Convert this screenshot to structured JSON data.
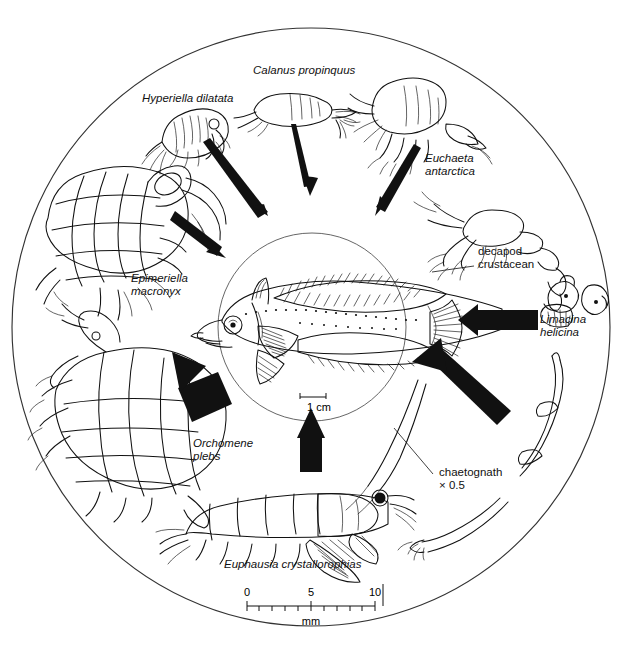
{
  "diagram": {
    "type": "food-web-circular",
    "title_visible": false,
    "center_organism": {
      "name": "antarctic-fish",
      "scalebar_label": "1 cm",
      "scalebar_length_px": 26
    },
    "outer_circle": {
      "cx": 311,
      "cy": 327,
      "r": 299
    },
    "inner_circle": {
      "cx": 312,
      "cy": 327,
      "r": 94
    },
    "prey": [
      {
        "id": "hyperiella",
        "label": "Hyperiella dilatata",
        "italic": true,
        "x": 142,
        "y": 92,
        "w": 126,
        "align": "left"
      },
      {
        "id": "calanus",
        "label": "Calanus propinquus",
        "italic": true,
        "x": 253,
        "y": 64,
        "w": 140,
        "align": "left"
      },
      {
        "id": "euchaeta",
        "label": "Euchaeta\nantarctica",
        "italic": true,
        "x": 425,
        "y": 152,
        "w": 90,
        "align": "left"
      },
      {
        "id": "decapod",
        "label": "decapod\ncrustacean",
        "italic": false,
        "x": 478,
        "y": 245,
        "w": 92,
        "align": "left"
      },
      {
        "id": "limacina",
        "label": "Limacina\nhelicina",
        "italic": true,
        "x": 540,
        "y": 313,
        "w": 78,
        "align": "left"
      },
      {
        "id": "chaetognath",
        "label": "chaetognath\n× 0.5",
        "italic": false,
        "x": 439,
        "y": 466,
        "w": 94,
        "align": "left"
      },
      {
        "id": "euphausia",
        "label": "Euphausia crystallorophias",
        "italic": true,
        "x": 224,
        "y": 558,
        "w": 180,
        "align": "left"
      },
      {
        "id": "orchomene",
        "label": "Orchomene\nplebs",
        "italic": true,
        "x": 193,
        "y": 437,
        "w": 84,
        "align": "left"
      },
      {
        "id": "epimeriella",
        "label": "Epimeriella\nmacronyx",
        "italic": true,
        "x": 131,
        "y": 272,
        "w": 86,
        "align": "left"
      }
    ],
    "arrows": [
      {
        "from": "hyperiella",
        "style": "thin-tapered",
        "x1": 205,
        "y1": 146,
        "x2": 262,
        "y2": 212
      },
      {
        "from": "calanus",
        "style": "thin-tapered",
        "x1": 294,
        "y1": 122,
        "x2": 308,
        "y2": 188
      },
      {
        "from": "euchaeta",
        "style": "thin-tapered",
        "x1": 410,
        "y1": 144,
        "x2": 382,
        "y2": 208
      },
      {
        "from": "epimeriella",
        "style": "thin-tapered",
        "x1": 171,
        "y1": 223,
        "x2": 217,
        "y2": 252
      },
      {
        "from": "limacina",
        "style": "thick-block",
        "x1": 536,
        "y1": 320,
        "x2": 461,
        "y2": 320
      },
      {
        "from": "chaetognath",
        "style": "thick-block",
        "x1": 493,
        "y1": 418,
        "x2": 412,
        "y2": 364
      },
      {
        "from": "euphausia",
        "style": "thick-block",
        "x1": 310,
        "y1": 470,
        "x2": 310,
        "y2": 410
      },
      {
        "from": "orchomene",
        "style": "thick-block",
        "x1": 216,
        "y1": 400,
        "x2": 178,
        "y2": 345
      }
    ],
    "leader_lines": [
      {
        "for": "decapod",
        "x1": 474,
        "y1": 265,
        "x2": 432,
        "y2": 272
      },
      {
        "for": "chaetognath-body",
        "x1": 432,
        "y1": 473,
        "x2": 392,
        "y2": 427
      }
    ],
    "scale_bar": {
      "name": "mm-scale-bar",
      "unit": "mm",
      "ticks": [
        "0",
        "5",
        "10"
      ],
      "minor_ticks": 10,
      "x_start": 247,
      "x_end": 375,
      "y": 605
    }
  }
}
